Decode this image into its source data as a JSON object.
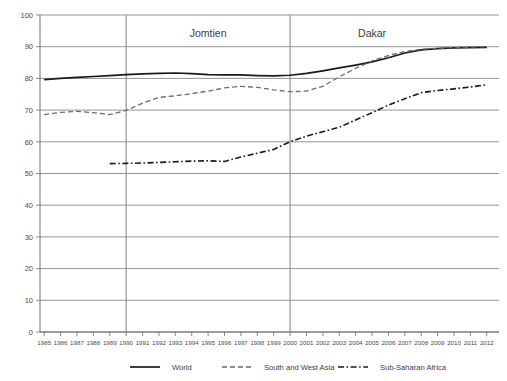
{
  "chart_data": {
    "type": "line",
    "title": "",
    "xlabel": "",
    "ylabel": "",
    "ylim": [
      0,
      100
    ],
    "ytick_values": [
      0,
      10,
      20,
      30,
      40,
      50,
      60,
      70,
      80,
      90,
      100
    ],
    "grid": true,
    "legend_position": "bottom",
    "x": [
      1985,
      1986,
      1987,
      1988,
      1989,
      1990,
      1991,
      1992,
      1993,
      1994,
      1995,
      1996,
      1997,
      1998,
      1999,
      2000,
      2001,
      2002,
      2003,
      2004,
      2005,
      2006,
      2007,
      2008,
      2009,
      2010,
      2011,
      2012
    ],
    "xtick_labels": [
      "1985",
      "1986",
      "1987",
      "1988",
      "1989",
      "1990",
      "1991",
      "1992",
      "1993",
      "1994",
      "1995",
      "1996",
      "1997",
      "1998",
      "1999",
      "2000",
      "2001",
      "2002",
      "2003",
      "2004",
      "2005",
      "2006",
      "2007",
      "2008",
      "2009",
      "2010",
      "2011",
      "2012"
    ],
    "annotations": [
      {
        "label": "Jomtien",
        "x": 1990,
        "type": "vertical-marker"
      },
      {
        "label": "Dakar",
        "x": 2000,
        "type": "vertical-marker"
      }
    ],
    "series": [
      {
        "name": "World",
        "style": "solid",
        "color": "#1a1a1a",
        "values": [
          79.6,
          80.0,
          80.3,
          80.6,
          80.9,
          81.2,
          81.4,
          81.6,
          81.7,
          81.5,
          81.2,
          81.1,
          81.1,
          80.9,
          80.8,
          81.0,
          81.6,
          82.4,
          83.3,
          84.2,
          85.2,
          86.5,
          88.0,
          89.0,
          89.4,
          89.6,
          89.7,
          89.8
        ]
      },
      {
        "name": "South and West Asia",
        "style": "dashed",
        "color": "#6b6b6b",
        "values": [
          68.6,
          69.3,
          69.6,
          69.2,
          68.6,
          69.9,
          72.2,
          74.0,
          74.5,
          75.2,
          76.0,
          77.0,
          77.5,
          77.2,
          76.4,
          75.8,
          76.0,
          77.5,
          80.5,
          83.2,
          85.5,
          87.2,
          88.5,
          89.2,
          89.5,
          89.7,
          89.9,
          90.0
        ]
      },
      {
        "name": "Sub-Saharan Africa",
        "style": "dashdot",
        "color": "#1a1a1a",
        "values": [
          null,
          null,
          null,
          null,
          53.1,
          53.2,
          53.3,
          53.5,
          53.7,
          53.9,
          54.0,
          53.8,
          55.2,
          56.4,
          57.6,
          60.0,
          61.8,
          63.2,
          64.6,
          66.9,
          69.2,
          71.6,
          73.6,
          75.5,
          76.2,
          76.7,
          77.3,
          78.0
        ]
      }
    ]
  },
  "legend": {
    "items": [
      {
        "label": "World"
      },
      {
        "label": "South and West Asia"
      },
      {
        "label": "Sub-Saharan Africa"
      }
    ]
  }
}
